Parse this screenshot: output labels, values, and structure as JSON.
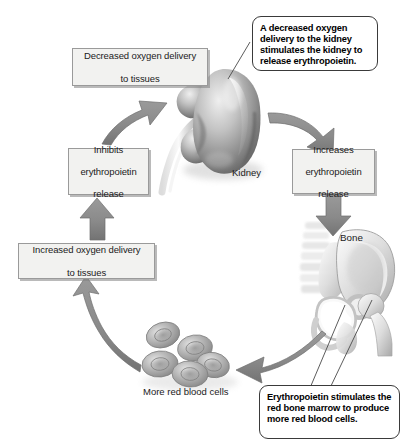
{
  "diagram": {
    "colors": {
      "arrow_gray": "#8d8d8d",
      "arrow_gray_dark": "#6f6f6f",
      "box_fill": "#f2f2f0",
      "box_border": "#9a9a9a",
      "callout_border": "#3a3a3a",
      "text": "#1b1b1b",
      "organ_gray": "#9b9b9b",
      "cell_gray": "#a7a7a7"
    },
    "boxes": [
      {
        "id": "decreased-oxygen-delivery",
        "name": "box-decreased-oxygen-delivery",
        "line1": "Decreased oxygen delivery",
        "line2": "to tissues"
      },
      {
        "id": "inhibits-release",
        "name": "box-inhibits-erythropoietin-release",
        "line1": "Inhibits",
        "line2": "erythropoietin",
        "line3": "release"
      },
      {
        "id": "increases-release",
        "name": "box-increases-erythropoietin-release",
        "line1": "Increases",
        "line2": "erythropoietin",
        "line3": "release"
      },
      {
        "id": "increased-oxygen-delivery",
        "name": "box-increased-oxygen-delivery",
        "line1": "Increased oxygen delivery",
        "line2": "to tissues"
      }
    ],
    "callouts": [
      {
        "id": "kidney-callout",
        "name": "callout-kidney-stimulation",
        "text": "A decreased oxygen delivery to the kidney stimulates the kidney to release erythropoietin."
      },
      {
        "id": "marrow-callout",
        "name": "callout-bone-marrow-stimulation",
        "text": "Erythropoietin stimulates the red bone marrow to produce more red blood cells."
      }
    ],
    "labels": [
      {
        "id": "kidney-label",
        "name": "label-kidney",
        "text": "Kidney"
      },
      {
        "id": "bone-label",
        "name": "label-bone",
        "text": "Bone"
      },
      {
        "id": "rbc-label",
        "name": "label-more-red-blood-cells",
        "text": "More red blood cells"
      }
    ],
    "arrows": [
      {
        "id": "arrow-kidney-to-increases",
        "name": "arrow-kidney-to-increases-release",
        "from": "kidney",
        "to": "increases-release"
      },
      {
        "id": "arrow-increases-to-bone",
        "name": "arrow-increases-release-to-bone",
        "from": "increases-release",
        "to": "bone"
      },
      {
        "id": "arrow-bone-to-rbc",
        "name": "arrow-bone-to-red-blood-cells",
        "from": "bone",
        "to": "red-blood-cells"
      },
      {
        "id": "arrow-rbc-to-increased-oxygen",
        "name": "arrow-red-blood-cells-to-increased-oxygen",
        "from": "red-blood-cells",
        "to": "increased-oxygen-delivery"
      },
      {
        "id": "arrow-increased-oxygen-to-inhibits",
        "name": "arrow-increased-oxygen-to-inhibits",
        "from": "increased-oxygen-delivery",
        "to": "inhibits-release"
      },
      {
        "id": "arrow-inhibits-to-kidney",
        "name": "arrow-inhibits-to-kidney",
        "from": "inhibits-release",
        "to": "kidney"
      }
    ],
    "illustrations": [
      {
        "id": "kidney-art",
        "name": "illustration-kidney"
      },
      {
        "id": "bone-art",
        "name": "illustration-pelvis-bone"
      },
      {
        "id": "rbc-art",
        "name": "illustration-red-blood-cells"
      }
    ]
  }
}
